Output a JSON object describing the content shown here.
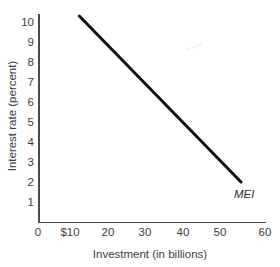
{
  "chart_data": {
    "type": "line",
    "title": "",
    "xlabel": "Investment (in billions)",
    "ylabel": "Interest rate (percent)",
    "xlim": [
      0,
      63
    ],
    "ylim": [
      0,
      10.8
    ],
    "grid": false,
    "legend_position": "inline-end-of-line",
    "x_ticks": [
      {
        "value": 0,
        "label": "0"
      },
      {
        "value": 10,
        "label": "$10"
      },
      {
        "value": 20,
        "label": "20"
      },
      {
        "value": 30,
        "label": "30"
      },
      {
        "value": 40,
        "label": "40"
      },
      {
        "value": 50,
        "label": "50"
      },
      {
        "value": 60,
        "label": "60"
      }
    ],
    "y_ticks": [
      {
        "value": 1,
        "label": "1"
      },
      {
        "value": 2,
        "label": "2"
      },
      {
        "value": 3,
        "label": "3"
      },
      {
        "value": 4,
        "label": "4"
      },
      {
        "value": 5,
        "label": "5"
      },
      {
        "value": 6,
        "label": "6"
      },
      {
        "value": 7,
        "label": "7"
      },
      {
        "value": 8,
        "label": "8"
      },
      {
        "value": 9,
        "label": "9"
      },
      {
        "value": 10,
        "label": "10"
      }
    ],
    "series": [
      {
        "name": "MEI",
        "annotation": "MEI",
        "color": "#111111",
        "line_width": 3,
        "points": [
          {
            "x": 11,
            "y": 10.3
          },
          {
            "x": 54,
            "y": 2.0
          }
        ]
      }
    ]
  },
  "axes": {
    "y_title": "Interest rate (percent)",
    "x_title": "Investment (in billions)"
  },
  "ticks": {
    "y": [
      "10",
      "9",
      "8",
      "7",
      "6",
      "5",
      "4",
      "3",
      "2",
      "1"
    ],
    "x": [
      "0",
      "$10",
      "20",
      "30",
      "40",
      "50",
      "60"
    ]
  },
  "annotations": {
    "mei": "MEI"
  }
}
